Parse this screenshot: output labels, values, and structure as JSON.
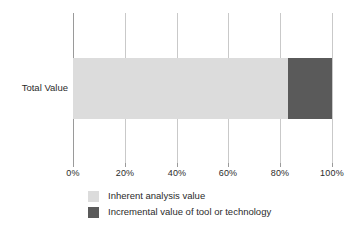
{
  "chart_data": {
    "type": "bar",
    "orientation": "horizontal",
    "stacked": true,
    "title": "",
    "xlabel": "",
    "ylabel": "",
    "categories": [
      "Total Value"
    ],
    "series": [
      {
        "name": "Inherent analysis value",
        "values": [
          83
        ],
        "color": "#dcdcdc"
      },
      {
        "name": "Incremental value of tool or technology",
        "values": [
          17
        ],
        "color": "#5a5a5a"
      }
    ],
    "xlim": [
      0,
      100
    ],
    "xticks": [
      0,
      20,
      40,
      60,
      80,
      100
    ],
    "xtick_labels": [
      "0%",
      "20%",
      "40%",
      "60%",
      "80%",
      "100%"
    ],
    "grid": "vertical",
    "legend_position": "bottom-center",
    "value_suffix": "%"
  },
  "axis": {
    "ticks": [
      {
        "label": "0%",
        "value": 0
      },
      {
        "label": "20%",
        "value": 20
      },
      {
        "label": "40%",
        "value": 40
      },
      {
        "label": "60%",
        "value": 60
      },
      {
        "label": "80%",
        "value": 80
      },
      {
        "label": "100%",
        "value": 100
      }
    ]
  },
  "bar": {
    "category_label": "Total Value",
    "segments": [
      {
        "name": "Inherent analysis value",
        "percent": 83,
        "color": "#dcdcdc"
      },
      {
        "name": "Incremental value of tool or technology",
        "percent": 17,
        "color": "#5a5a5a"
      }
    ]
  },
  "legend": {
    "items": [
      {
        "label": "Inherent analysis value",
        "color": "#dcdcdc"
      },
      {
        "label": "Incremental value of tool or technology",
        "color": "#5a5a5a"
      }
    ]
  },
  "artifact": {
    "text": ""
  }
}
